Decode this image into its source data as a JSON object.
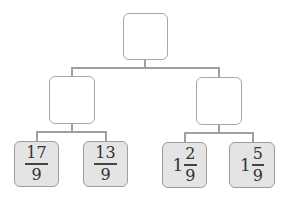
{
  "diagram": {
    "type": "tree",
    "root": {
      "label": ""
    },
    "middle": [
      {
        "label": ""
      },
      {
        "label": ""
      }
    ],
    "leaves": [
      {
        "whole": "",
        "numerator": "17",
        "denominator": "9"
      },
      {
        "whole": "",
        "numerator": "13",
        "denominator": "9"
      },
      {
        "whole": "1",
        "numerator": "2",
        "denominator": "9"
      },
      {
        "whole": "1",
        "numerator": "5",
        "denominator": "9"
      }
    ]
  },
  "colors": {
    "leaf_fill": "#e4e4e4",
    "border": "#a0a0a0",
    "empty_fill": "#ffffff"
  }
}
